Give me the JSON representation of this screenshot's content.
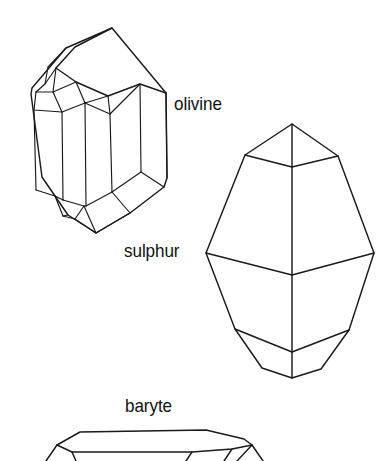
{
  "figure": {
    "kind": "mineral-crystal-habit-line-drawing",
    "background_color": "#ffffff",
    "line_color": "#1a1a1a",
    "width": 386,
    "height": 461
  },
  "labels": {
    "olivine": "olivine",
    "sulphur": "sulphur",
    "baryte": "baryte"
  },
  "specimens": [
    {
      "name": "olivine",
      "label": "olivine",
      "label_position": {
        "x": 174,
        "y": 94
      },
      "description": "Tabular orthorhombic crystal drawn in oblique projection with prism faces and beveled terminations at top and bottom."
    },
    {
      "name": "sulphur",
      "label": "sulphur",
      "label_position": {
        "x": 124,
        "y": 241
      },
      "description": "Dipyramidal orthorhombic crystal with a pointed upper pyramid, a broad medial girdle and a pointed lower pyramid."
    },
    {
      "name": "baryte",
      "label": "baryte",
      "label_position": {
        "x": 125,
        "y": 396
      },
      "description": "Flat tabular crystal shown edge on, cropped by the lower border of the figure."
    }
  ]
}
